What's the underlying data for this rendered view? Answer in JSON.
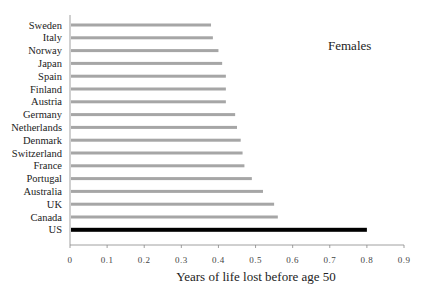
{
  "chart_data": {
    "type": "bar",
    "orientation": "horizontal",
    "title": "",
    "annotation": "Females",
    "xlabel": "Years of life lost before age 50",
    "ylabel": "",
    "xlim": [
      0,
      0.9
    ],
    "xticks": [
      "0",
      "0.1",
      "0.2",
      "0.3",
      "0.4",
      "0.5",
      "0.6",
      "0.7",
      "0.8",
      "0.9"
    ],
    "grid": false,
    "legend": null,
    "categories": [
      "Sweden",
      "Italy",
      "Norway",
      "Japan",
      "Spain",
      "Finland",
      "Austria",
      "Germany",
      "Netherlands",
      "Denmark",
      "Switzerland",
      "France",
      "Portugal",
      "Australia",
      "UK",
      "Canada",
      "US"
    ],
    "values": [
      0.38,
      0.385,
      0.4,
      0.41,
      0.42,
      0.42,
      0.42,
      0.445,
      0.45,
      0.46,
      0.465,
      0.47,
      0.49,
      0.52,
      0.55,
      0.56,
      0.8
    ],
    "highlight": "US",
    "colors": {
      "bar": "#a6a6a6",
      "highlight": "#000000",
      "axis": "#888888"
    }
  }
}
